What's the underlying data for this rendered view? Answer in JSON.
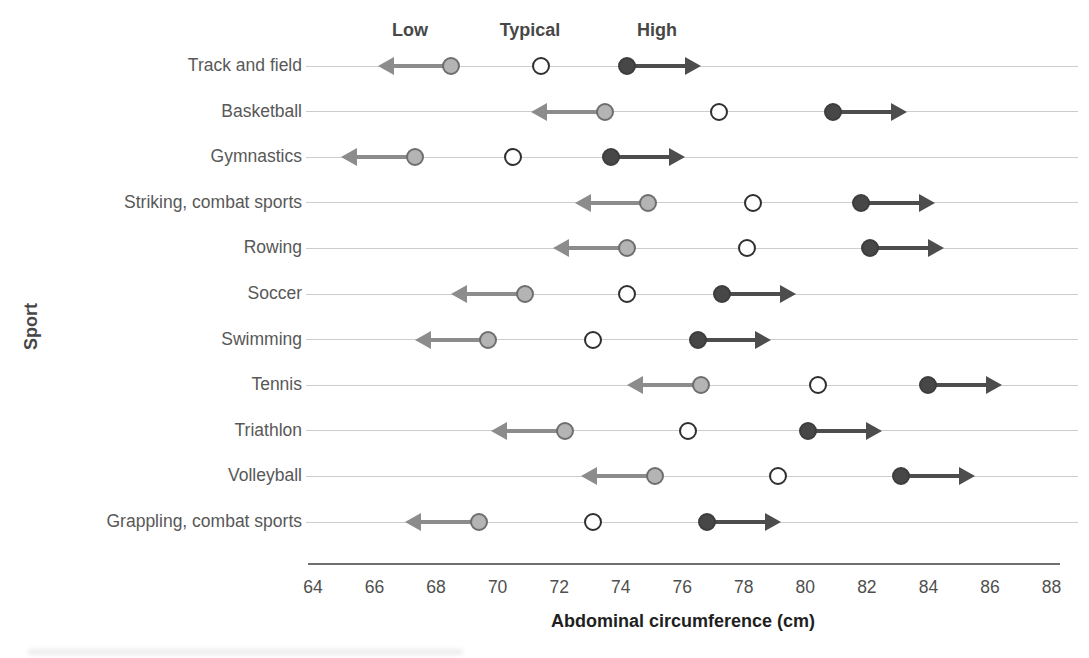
{
  "chart_data": {
    "type": "scatter",
    "subtype": "dot-and-arrow range chart",
    "title": "",
    "xlabel": "Abdominal circumference (cm)",
    "ylabel": "Sport",
    "xlim": [
      64,
      88
    ],
    "x_ticks": [
      64,
      66,
      68,
      70,
      72,
      74,
      76,
      78,
      80,
      82,
      84,
      86,
      88
    ],
    "grid": "horizontal light row lines",
    "legend_position": "above first row",
    "legend": [
      "Low",
      "Typical",
      "High"
    ],
    "arrow_extent_cm": 2.4,
    "categories": [
      "Track and field",
      "Basketball",
      "Gymnastics",
      "Striking, combat sports",
      "Rowing",
      "Soccer",
      "Swimming",
      "Tennis",
      "Triathlon",
      "Volleyball",
      "Grappling, combat sports"
    ],
    "series": [
      {
        "name": "Low",
        "marker": "filled gray circle, arrow pointing left",
        "values": [
          68.5,
          73.5,
          67.3,
          74.9,
          74.2,
          70.9,
          69.7,
          76.6,
          72.2,
          75.1,
          69.4
        ]
      },
      {
        "name": "Typical",
        "marker": "open white circle",
        "values": [
          71.4,
          77.2,
          70.5,
          78.3,
          78.1,
          74.2,
          73.1,
          80.4,
          76.2,
          79.1,
          73.1
        ]
      },
      {
        "name": "High",
        "marker": "filled dark circle, arrow pointing right",
        "values": [
          74.2,
          80.9,
          73.7,
          81.8,
          82.1,
          77.3,
          76.5,
          84.0,
          80.1,
          83.1,
          76.8
        ]
      }
    ],
    "colors": {
      "low_dot_fill": "#b4b4b4",
      "low_dot_stroke": "#6e6e6e",
      "typical_dot_fill": "#ffffff",
      "typical_dot_stroke": "#2f2f2f",
      "high_dot_fill": "#474747",
      "left_arrow": "#8c8c8c",
      "right_arrow": "#4d4d4d",
      "row_line": "#cccccc",
      "axis_line": "#6f6f6f",
      "label_text": "#585858",
      "bold_text": "#474747"
    }
  }
}
